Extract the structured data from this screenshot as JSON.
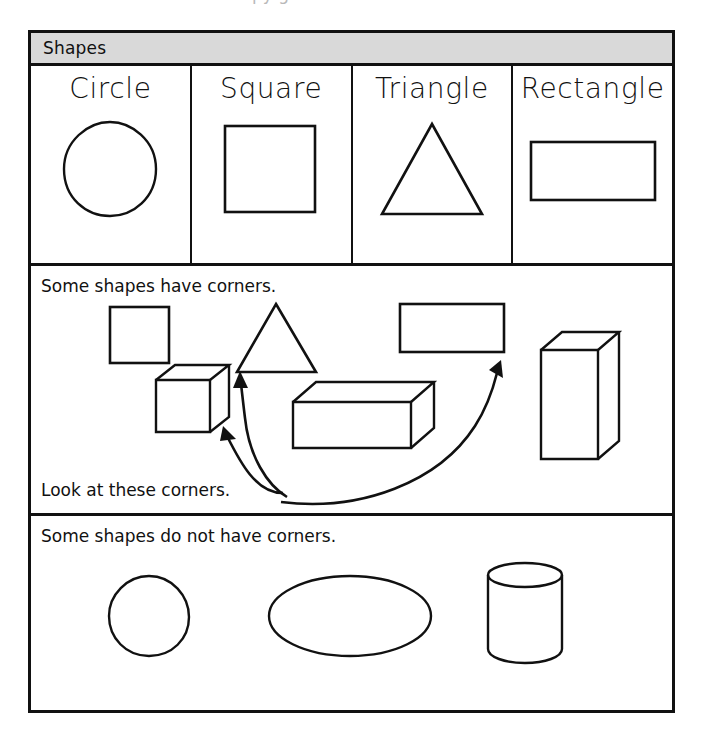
{
  "page": {
    "top_partial_text": "py g",
    "background_color": "#ffffff",
    "ink_color": "#111111",
    "header_band_color": "#d9d9d9"
  },
  "header": {
    "title": "Shapes"
  },
  "gallery": {
    "cells": [
      {
        "label": "Circle",
        "figure": "circle-outline"
      },
      {
        "label": "Square",
        "figure": "square-outline"
      },
      {
        "label": "Triangle",
        "figure": "triangle-outline"
      },
      {
        "label": "Rectangle",
        "figure": "rectangle-outline"
      }
    ]
  },
  "corners_section": {
    "caption": "Some shapes have corners.",
    "subcaption": "Look at these corners.",
    "figures": [
      {
        "name": "square-outline",
        "description": "square"
      },
      {
        "name": "triangle-outline",
        "description": "triangle"
      },
      {
        "name": "rectangle-outline",
        "description": "rectangle"
      },
      {
        "name": "cube-3d",
        "description": "cube"
      },
      {
        "name": "rectangular-prism-3d",
        "description": "horizontal box"
      },
      {
        "name": "tall-rectangular-prism-3d",
        "description": "tall vertical box"
      }
    ],
    "pointers": [
      {
        "name": "arrow-to-cube-corner",
        "target": "cube-3d"
      },
      {
        "name": "arrow-to-triangle-corner",
        "target": "triangle-outline"
      },
      {
        "name": "arrow-to-rectangle-corner",
        "target": "rectangle-outline"
      }
    ]
  },
  "nocorners_section": {
    "caption": "Some shapes do not have corners.",
    "figures": [
      {
        "name": "circle-outline",
        "description": "circle"
      },
      {
        "name": "ellipse-outline",
        "description": "oval"
      },
      {
        "name": "cylinder-3d",
        "description": "cylinder"
      }
    ]
  }
}
